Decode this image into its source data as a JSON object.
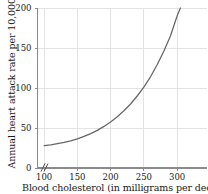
{
  "chart_data": {
    "type": "line",
    "title": "",
    "xlabel": "Blood cholesterol (in milligrams per deciliter",
    "ylabel": "Annual heart attack rate per 10,000 men",
    "xlim": [
      90,
      345
    ],
    "ylim": [
      0,
      200
    ],
    "xticks": [
      100,
      150,
      200,
      250,
      300
    ],
    "xticklabels": [
      "100",
      "150",
      "200",
      "250",
      "300"
    ],
    "yticks": [
      0,
      50,
      100,
      150,
      200
    ],
    "yticklabels": [
      "0",
      "50",
      "100",
      "150",
      "200"
    ],
    "grid": true,
    "legend": null,
    "axis_break": "//",
    "series": [
      {
        "name": "heart attack rate",
        "color": "#666666",
        "x": [
          100,
          110,
          120,
          130,
          140,
          150,
          160,
          170,
          180,
          190,
          200,
          210,
          220,
          230,
          240,
          250,
          260,
          270,
          280,
          290,
          300,
          305
        ],
        "values": [
          28,
          29,
          30.5,
          32,
          34,
          36.5,
          39.5,
          43,
          47,
          52,
          57.5,
          64,
          71.5,
          80,
          90,
          101,
          114,
          129,
          146,
          165,
          190,
          200
        ]
      }
    ],
    "colors": {
      "curve": "#666666",
      "grid": "#e0e0e0",
      "axis": "#888888",
      "text": "#1a1a1a",
      "background": "#ffffff"
    }
  },
  "figure": {
    "xlabel_text": "Blood cholesterol (in milligrams per deciliter",
    "ylabel_text": "Annual heart attack rate per 10,000 men"
  }
}
